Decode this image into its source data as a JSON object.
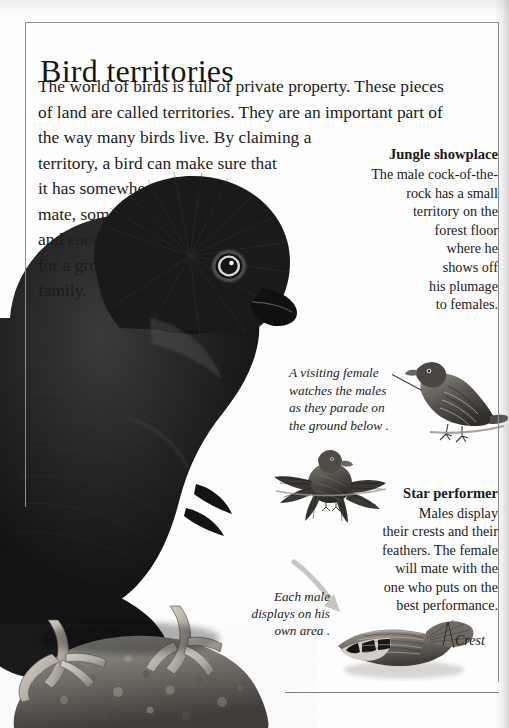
{
  "page": {
    "title": "Bird territories",
    "bg_color": "#fefefe",
    "rule_color": "#8d8d8d",
    "text_color": "#1b1b1b"
  },
  "intro": {
    "lines": [
      "The world of birds is full of private property. These pieces",
      "of land are called territories. They are an important part of",
      "the way many birds live. By claiming a",
      "territory, a bird can make sure that",
      "it has somewhere to attract a",
      "mate, somewhere to nest,",
      "and enough space",
      "for a growing",
      "family."
    ]
  },
  "showplace": {
    "heading": "Jungle showplace",
    "lines": [
      "The male cock-of-the-",
      "rock has a small",
      "territory on the",
      "forest floor",
      "where he",
      "shows off",
      "his plumage",
      "to females."
    ]
  },
  "visiting_female": {
    "lines": [
      "A visiting female",
      "watches the males",
      "as they parade on",
      "the ground below ."
    ]
  },
  "star_performer": {
    "heading": "Star performer",
    "lines": [
      "Males display",
      "their crests and their",
      "feathers. The female",
      "will mate with the",
      "one who puts on the",
      "best performance."
    ]
  },
  "each_male": {
    "lines": [
      "Each male",
      "displays on his",
      "own area ."
    ]
  },
  "crest": {
    "label": "Crest"
  },
  "illustrations": {
    "main_photo": "cock-of-the-rock-male-photo",
    "female_bird": "perched-female-bird-drawing",
    "displaying_bird": "displaying-male-bird-drawing",
    "ground_bird": "ground-displaying-bird-drawing"
  }
}
